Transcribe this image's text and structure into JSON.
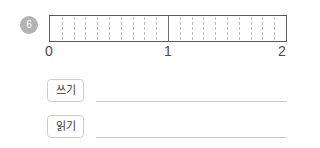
{
  "question": {
    "number": "6"
  },
  "numberline": {
    "start_label": "0",
    "mid_label": "1",
    "end_label": "2",
    "subdivisions_per_unit": 10,
    "units": 2,
    "bar_border_color": "#5a5a5a",
    "minor_tick_color": "#bdbdbd",
    "major_tick_color": "#6e6e6e"
  },
  "answers": {
    "write": {
      "button_label": "쓰기",
      "value": ""
    },
    "read": {
      "button_label": "읽기",
      "value": ""
    }
  },
  "chart_data": {
    "type": "bar",
    "title": "",
    "xlabel": "",
    "ylabel": "",
    "orientation": "horizontal-numberline",
    "xlim": [
      0,
      2
    ],
    "tick_labels": [
      "0",
      "1",
      "2"
    ],
    "major_ticks": [
      0,
      1,
      2
    ],
    "minor_tick_step": 0.1,
    "minor_ticks": [
      0.1,
      0.2,
      0.3,
      0.4,
      0.5,
      0.6,
      0.7,
      0.8,
      0.9,
      1.1,
      1.2,
      1.3,
      1.4,
      1.5,
      1.6,
      1.7,
      1.8,
      1.9
    ],
    "grid": true,
    "legend": "none",
    "categories": [
      "unit 1",
      "unit 2"
    ],
    "values": [
      1,
      1
    ]
  }
}
